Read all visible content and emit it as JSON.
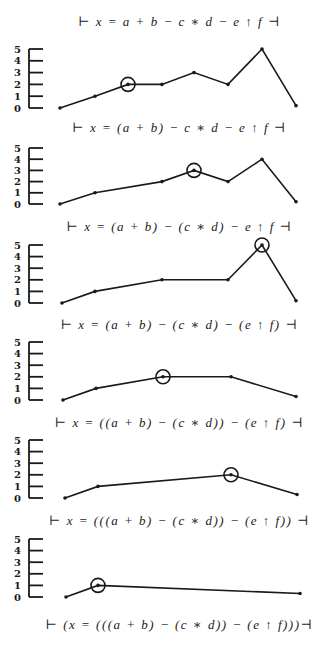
{
  "figure": {
    "equations": [
      "⊢ x = a + b − c ∗ d − e ↑ f ⊣",
      "⊢ x = (a + b) − c ∗ d − e ↑ f ⊣",
      "⊢ x = (a + b) − (c ∗ d) − e ↑ f ⊣",
      "⊢ x = (a + b) − (c ∗ d) − (e ↑ f) ⊣",
      "⊢ x = ((a + b) − (c ∗ d)) − (e ↑ f) ⊣",
      "⊢ x = (((a + b) − (c ∗ d)) − (e ↑ f)) ⊣",
      "⊢ (x = (((a + b) − (c ∗ d)) − (e ↑ f)))⊣"
    ],
    "equation_y": [
      14,
      120,
      219,
      317,
      415,
      513,
      617
    ],
    "y_axis_ticks": [
      "0",
      "1",
      "2",
      "3",
      "4",
      "5"
    ],
    "colors": {
      "ink": "#1a1a1a",
      "background": "#ffffff"
    }
  },
  "chart_data": [
    {
      "type": "line",
      "title": "⊢ x = a + b − c ∗ d − e ↑ f ⊣",
      "ylabel": "precedence level",
      "ylim": [
        0,
        5
      ],
      "yticks": [
        0,
        1,
        2,
        3,
        4,
        5
      ],
      "x": [
        60,
        95,
        128,
        162,
        194,
        228,
        262,
        296
      ],
      "values": [
        0,
        1,
        2,
        2,
        3,
        2,
        5,
        0.2
      ],
      "circled_index": 2,
      "axis_top_y": 49,
      "axis_bottom_y": 108
    },
    {
      "type": "line",
      "title": "⊢ x = (a + b) − c ∗ d − e ↑ f ⊣",
      "ylabel": "precedence level",
      "ylim": [
        0,
        5
      ],
      "yticks": [
        0,
        1,
        2,
        3,
        4,
        5
      ],
      "x": [
        60,
        95,
        162,
        194,
        228,
        262,
        296
      ],
      "values": [
        0,
        1,
        2,
        3,
        2,
        4,
        0.2
      ],
      "circled_index": 3,
      "axis_top_y": 148,
      "axis_bottom_y": 204
    },
    {
      "type": "line",
      "title": "⊢ x = (a + b) − (c ∗ d) − e ↑ f ⊣",
      "ylabel": "precedence level",
      "ylim": [
        0,
        5
      ],
      "yticks": [
        0,
        1,
        2,
        3,
        4,
        5
      ],
      "x": [
        62,
        95,
        162,
        228,
        262,
        296
      ],
      "values": [
        0,
        1,
        2,
        2,
        5,
        0.2
      ],
      "circled_index": 4,
      "axis_top_y": 245,
      "axis_bottom_y": 303
    },
    {
      "type": "line",
      "title": "⊢ x = (a + b) − (c ∗ d) − (e ↑ f) ⊣",
      "ylabel": "precedence level",
      "ylim": [
        0,
        5
      ],
      "yticks": [
        0,
        1,
        2,
        3,
        4,
        5
      ],
      "x": [
        63,
        96,
        163,
        231,
        296
      ],
      "values": [
        0,
        1,
        2,
        2,
        0.3
      ],
      "circled_index": 2,
      "axis_top_y": 342,
      "axis_bottom_y": 400
    },
    {
      "type": "line",
      "title": "⊢ x = ((a + b) − (c ∗ d)) − (e ↑ f) ⊣",
      "ylabel": "precedence level",
      "ylim": [
        0,
        5
      ],
      "yticks": [
        0,
        1,
        2,
        3,
        4,
        5
      ],
      "x": [
        65,
        98,
        231,
        297
      ],
      "values": [
        0,
        1,
        2,
        0.3
      ],
      "circled_index": 2,
      "axis_top_y": 440,
      "axis_bottom_y": 498
    },
    {
      "type": "line",
      "title": "⊢ x = (((a + b) − (c ∗ d)) − (e ↑ f)) ⊣",
      "ylabel": "precedence level",
      "ylim": [
        0,
        5
      ],
      "yticks": [
        0,
        1,
        2,
        3,
        4,
        5
      ],
      "x": [
        66,
        98,
        300
      ],
      "values": [
        0,
        1,
        0.3
      ],
      "circled_index": 1,
      "axis_top_y": 539,
      "axis_bottom_y": 597
    }
  ]
}
